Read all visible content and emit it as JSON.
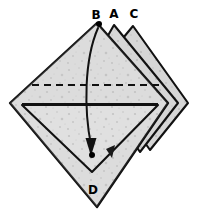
{
  "figure": {
    "canvas": {
      "width": 203,
      "height": 218
    },
    "colors": {
      "background": "#ffffff",
      "paper_fill": "#dcdcdc",
      "paper_fill_light": "#e6e6e6",
      "paper_fill_shadow": "#cfcfcf",
      "stroke": "#111111",
      "label": "#000000",
      "dot": "#000000"
    },
    "labels": [
      {
        "id": "B",
        "text": "B",
        "x": 96,
        "y": 14
      },
      {
        "id": "A",
        "text": "A",
        "x": 114,
        "y": 13
      },
      {
        "id": "C",
        "text": "C",
        "x": 134,
        "y": 13
      },
      {
        "id": "D",
        "text": "D",
        "x": 93,
        "y": 190
      }
    ],
    "dots": [
      {
        "id": "dot-b",
        "x": 99,
        "y": 24,
        "r": 3.0
      },
      {
        "id": "dot-target",
        "x": 92,
        "y": 155,
        "r": 3.0
      }
    ],
    "layers": [
      {
        "id": "layer-c",
        "name": "flap-c",
        "apex": {
          "x": 133,
          "y": 26
        },
        "points": "133,26 188,103 150,150 95,72"
      },
      {
        "id": "layer-a",
        "name": "flap-a",
        "apex": {
          "x": 114,
          "y": 25
        },
        "points": "114,25 178,103 140,152 86,74"
      },
      {
        "id": "layer-b",
        "name": "main-sheet",
        "apex": {
          "x": 97,
          "y": 23
        },
        "points": "97,23 168,103 97,207 10,103"
      }
    ],
    "inner_triangle": {
      "id": "inner-flap",
      "points": "22,105 158,105 92,172"
    },
    "fold_line_dashed": {
      "id": "valley-fold",
      "x1": 32,
      "y1": 85,
      "x2": 162,
      "y2": 85,
      "dash": "7 5"
    },
    "fold_line_solid": {
      "id": "horizontal-crease",
      "x1": 22,
      "y1": 104,
      "x2": 158,
      "y2": 104
    },
    "fold_arrow": {
      "id": "fold-arrow-b-to-d",
      "path": "M 98 28 C 84 60, 84 110, 91 145",
      "arrowhead": "91,155 86,139 96,139",
      "from": "B",
      "to": "interior point near D"
    },
    "small_marker": {
      "id": "pleat-marker",
      "points": "107,150 115,146 112,157"
    }
  }
}
